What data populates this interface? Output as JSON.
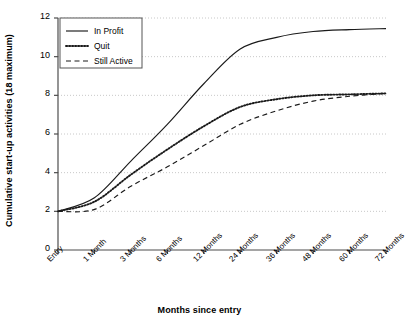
{
  "chart_data": {
    "type": "line",
    "title": "",
    "xlabel": "Months since entry",
    "ylabel": "Cumulative start-up activities (18 maximum)",
    "categories": [
      "Entry",
      "1 Month",
      "3 Months",
      "6 Months",
      "12 Months",
      "24 Months",
      "36 Months",
      "48 Months",
      "60 Months",
      "72 Months"
    ],
    "ylim": [
      0,
      12
    ],
    "yticks": [
      0,
      2,
      4,
      6,
      8,
      10,
      12
    ],
    "grid": true,
    "legend_position": "top-left",
    "series": [
      {
        "name": "In Profit",
        "style": "solid",
        "values": [
          2.0,
          2.7,
          4.6,
          6.5,
          8.6,
          10.4,
          11.0,
          11.3,
          11.4,
          11.45
        ]
      },
      {
        "name": "Quit",
        "style": "dotted",
        "values": [
          2.0,
          2.5,
          3.9,
          5.2,
          6.4,
          7.4,
          7.8,
          8.0,
          8.05,
          8.1
        ]
      },
      {
        "name": "Still Active",
        "style": "dashed",
        "values": [
          2.0,
          2.1,
          3.3,
          4.3,
          5.4,
          6.5,
          7.2,
          7.7,
          7.95,
          8.1
        ]
      }
    ]
  },
  "axes": {
    "y_tick_labels": [
      "0",
      "2",
      "4",
      "6",
      "8",
      "10",
      "12"
    ],
    "x_tick_labels": [
      "Entry",
      "1 Month",
      "3 Months",
      "6 Months",
      "12 Months",
      "24 Months",
      "36 Months",
      "48 Months",
      "60 Months",
      "72 Months"
    ],
    "y_axis_title": "Cumulative start-up activities (18 maximum)",
    "x_axis_title": "Months since entry"
  },
  "legend": {
    "items": [
      {
        "label": "In Profit",
        "style": "solid"
      },
      {
        "label": "Quit",
        "style": "dotted"
      },
      {
        "label": "Still Active",
        "style": "dashed"
      }
    ]
  },
  "colors": {
    "line": "#1a1a1a",
    "grid": "#c8c8c8",
    "axis": "#4d4d4d",
    "background": "#ffffff"
  }
}
